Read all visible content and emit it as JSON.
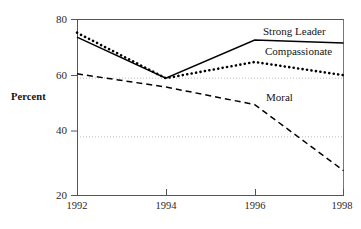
{
  "chart_data": {
    "type": "line",
    "title": "",
    "xlabel": "",
    "ylabel": "Percent",
    "x": [
      1992,
      1994,
      1996,
      1998
    ],
    "xticklabels": [
      "1992",
      "1994",
      "1996",
      "1998"
    ],
    "yticklabels": [
      "20",
      "40",
      "60",
      "80"
    ],
    "yticks": [
      20,
      40,
      60,
      80
    ],
    "ylim": [
      20,
      80
    ],
    "xlim": [
      1992,
      1998
    ],
    "grid": "horizontal-dotted-at-40-and-60",
    "legend_position": "inline-end-labels",
    "series": [
      {
        "name": "Strong Leader",
        "style": "solid",
        "color": "#000000",
        "values": [
          74,
          60,
          73,
          72
        ]
      },
      {
        "name": "Compassionate",
        "style": "dotted",
        "color": "#000000",
        "values": [
          75.5,
          60,
          65.5,
          61
        ]
      },
      {
        "name": "Moral",
        "style": "dashed",
        "color": "#000000",
        "values": [
          61.5,
          57,
          51,
          28.5
        ]
      }
    ],
    "annotations": [
      {
        "text": "Strong Leader",
        "series": "Strong Leader"
      },
      {
        "text": "Compassionate",
        "series": "Compassionate"
      },
      {
        "text": "Moral",
        "series": "Moral"
      }
    ]
  },
  "axis": {
    "y_label": "Percent",
    "y_ticks": [
      "80",
      "60",
      "40",
      "20"
    ],
    "x_ticks": [
      "1992",
      "1994",
      "1996",
      "1998"
    ]
  },
  "labels": {
    "strong_leader": "Strong Leader",
    "compassionate": "Compassionate",
    "moral": "Moral"
  }
}
